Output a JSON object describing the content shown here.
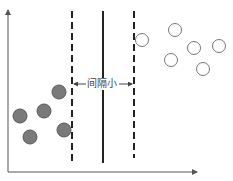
{
  "diagram": {
    "title": "",
    "annotation": "间隔小",
    "colors": {
      "axis": "#555555",
      "line": "#222222",
      "filled_point": "#7a7a7a",
      "filled_stroke": "#5a5a5a",
      "hollow_stroke": "#777777"
    },
    "axes": {
      "origin": [
        8,
        172
      ],
      "x_end": 197,
      "y_end": 10
    },
    "boundaries": [
      {
        "name": "left-margin",
        "style": "dashed",
        "x": 72,
        "y1": 11,
        "y2": 163
      },
      {
        "name": "decision-boundary",
        "style": "solid",
        "x": 103,
        "y1": 11,
        "y2": 163
      },
      {
        "name": "right-margin",
        "style": "dashed",
        "x": 134,
        "y1": 11,
        "y2": 158
      }
    ],
    "filled_points": [
      {
        "x": 59,
        "y": 92
      },
      {
        "x": 44,
        "y": 111
      },
      {
        "x": 20,
        "y": 116
      },
      {
        "x": 30,
        "y": 137
      },
      {
        "x": 64,
        "y": 130
      }
    ],
    "hollow_points": [
      {
        "x": 142,
        "y": 40
      },
      {
        "x": 175,
        "y": 30
      },
      {
        "x": 194,
        "y": 48
      },
      {
        "x": 219,
        "y": 46
      },
      {
        "x": 171,
        "y": 60
      },
      {
        "x": 203,
        "y": 69
      }
    ]
  }
}
